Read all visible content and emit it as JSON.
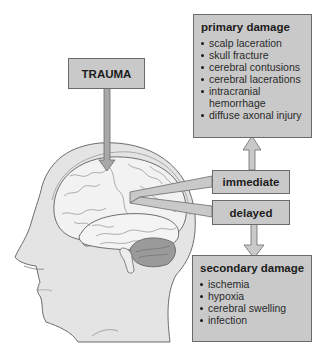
{
  "diagram": {
    "trauma": {
      "label": "TRAUMA"
    },
    "primary_damage": {
      "title": "primary damage",
      "items": [
        "scalp laceration",
        "skull fracture",
        "cerebral contusions",
        "cerebral lacerations",
        "intracranial hemorrhage",
        "diffuse axonal injury"
      ]
    },
    "immediate": {
      "label": "immediate"
    },
    "delayed": {
      "label": "delayed"
    },
    "secondary_damage": {
      "title": "secondary damage",
      "items": [
        "ischemia",
        "hypoxia",
        "cerebral swelling",
        "infection"
      ]
    },
    "colors": {
      "box_fill": "#c9c9c9",
      "box_border": "#6b6b6b",
      "head_fill": "#e4e4e4",
      "brain_fill": "#f2f2f2",
      "cerebellum_fill": "#9a9a9a"
    }
  }
}
